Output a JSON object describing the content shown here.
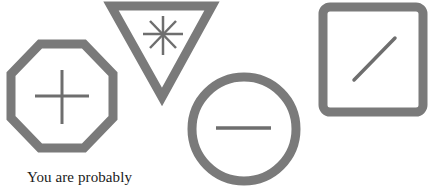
{
  "figure": {
    "stroke_color": "#7a7a7a",
    "shapes": [
      {
        "shape": "octagon",
        "symbol": "plus",
        "label": "+"
      },
      {
        "shape": "inverted-triangle",
        "symbol": "asterisk",
        "label": "*"
      },
      {
        "shape": "circle",
        "symbol": "minus",
        "label": "−"
      },
      {
        "shape": "rounded-square",
        "symbol": "slash",
        "label": "/"
      }
    ]
  },
  "caption": {
    "text": "You are probably"
  }
}
